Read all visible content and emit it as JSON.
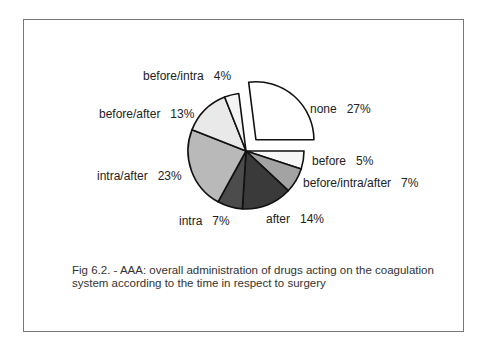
{
  "chart_data": {
    "type": "pie",
    "title": "",
    "exploded": "none",
    "slices": [
      {
        "label": "none",
        "value": 27,
        "color": "#ffffff",
        "exploded": true
      },
      {
        "label": "before",
        "value": 5,
        "color": "#f7f7f7"
      },
      {
        "label": "before/intra/after",
        "value": 7,
        "color": "#a3a3a3"
      },
      {
        "label": "after",
        "value": 14,
        "color": "#3a3a3a"
      },
      {
        "label": "intra",
        "value": 7,
        "color": "#4c4c4c"
      },
      {
        "label": "intra/after",
        "value": 23,
        "color": "#b9b9b9"
      },
      {
        "label": "before/after",
        "value": 13,
        "color": "#e9e9e9"
      },
      {
        "label": "before/intra",
        "value": 4,
        "color": "#f4f4f4"
      }
    ]
  },
  "labels": {
    "none": "none   27%",
    "before": "before   5%",
    "bia": "before/intra/after   7%",
    "after": "after   14%",
    "intra": "intra   7%",
    "intra_after": "intra/after   23%",
    "before_after": "before/after   13%",
    "before_intra": "before/intra   4%"
  },
  "caption": {
    "line1": "Fig  6.2. - AAA: overall administration  of drugs  acting on the coagulation",
    "line2": "system according to the time in respect to surgery"
  }
}
